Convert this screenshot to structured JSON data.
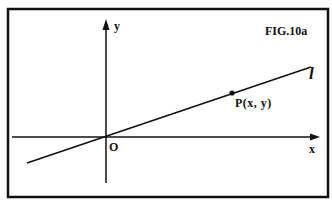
{
  "figure": {
    "label": "FIG.10a",
    "axes": {
      "x_label": "x",
      "y_label": "y",
      "origin_label": "O"
    },
    "line_label": "l",
    "point_label": "P(x, y)"
  },
  "colors": {
    "ink": "#111111",
    "background": "#ffffff"
  }
}
